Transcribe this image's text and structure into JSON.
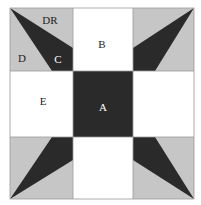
{
  "diagram": {
    "colors": {
      "light_gray": "#c6c6c6",
      "dark": "#2a2a2a",
      "white": "#ffffff",
      "border": "#9a9a9a"
    },
    "grid": {
      "cols": [
        10,
        73,
        133,
        194
      ],
      "rows": [
        8,
        71,
        137,
        199
      ]
    },
    "labels": [
      {
        "id": "DR",
        "text": "DR",
        "x": 50,
        "y": 24,
        "color": "#222222"
      },
      {
        "id": "D",
        "text": "D",
        "x": 22,
        "y": 62,
        "color": "#222222"
      },
      {
        "id": "C",
        "text": "C",
        "x": 58,
        "y": 63,
        "color": "#ffffff"
      },
      {
        "id": "B",
        "text": "B",
        "x": 102,
        "y": 48,
        "color": "#222222"
      },
      {
        "id": "E",
        "text": "E",
        "x": 43,
        "y": 105,
        "color": "#222222"
      },
      {
        "id": "A",
        "text": "A",
        "x": 103,
        "y": 111,
        "color": "#ffffff"
      }
    ]
  }
}
